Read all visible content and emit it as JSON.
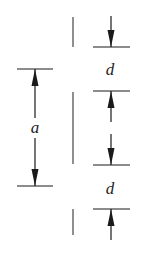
{
  "diagram": {
    "labels": {
      "left_dimension": "a",
      "right_dimension_top": "d",
      "right_dimension_bottom": "d"
    },
    "colors": {
      "line": "#1a1a1a",
      "background": "#ffffff"
    }
  }
}
